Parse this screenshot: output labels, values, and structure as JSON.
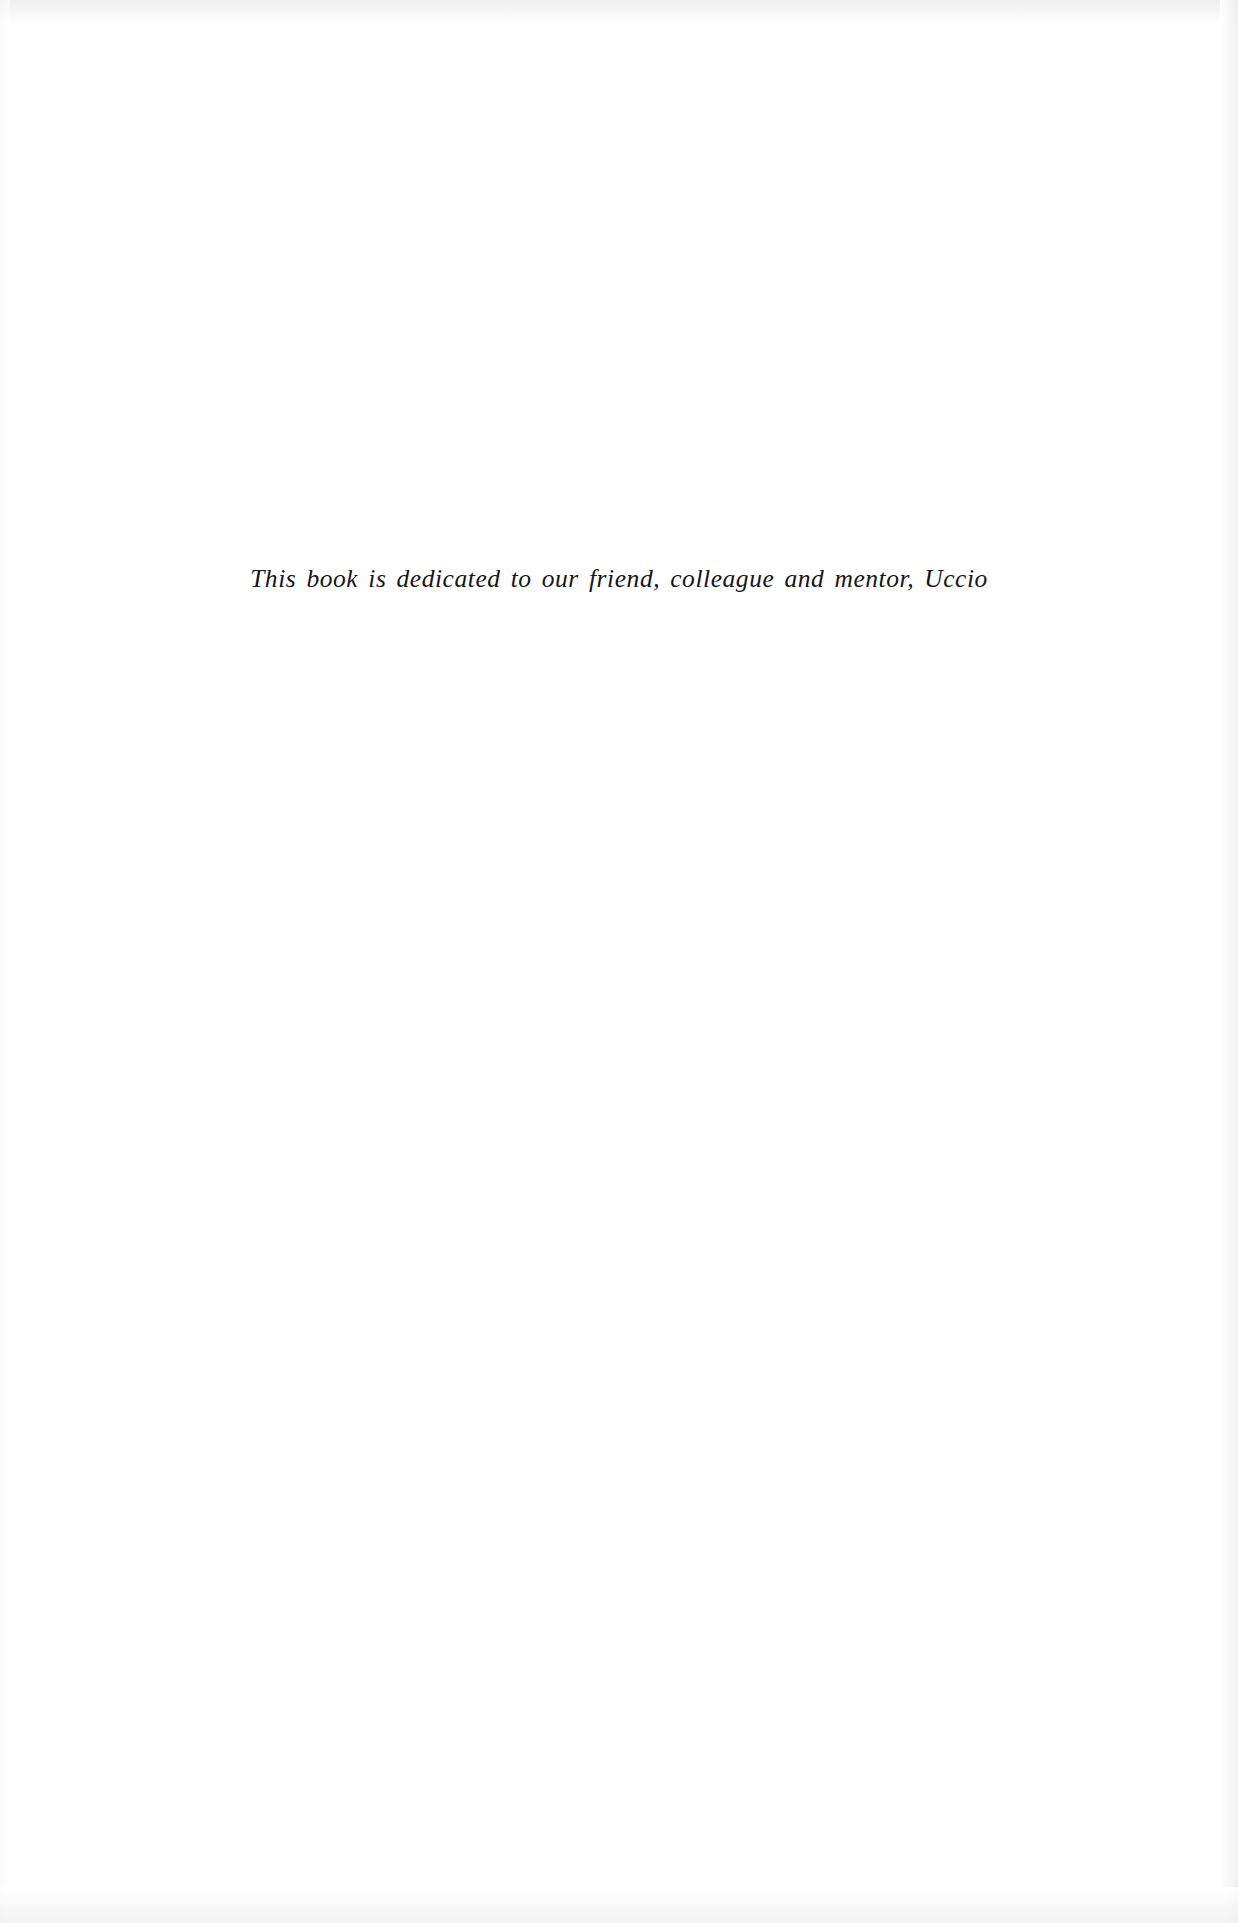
{
  "document": {
    "type": "book-dedication-page",
    "page_background_color": "#ffffff",
    "ink_color": "#161618",
    "dedication": {
      "text": "This book is dedicated to our friend, colleague and mentor, Uccio",
      "style": "italic-serif",
      "alignment": "center"
    }
  }
}
